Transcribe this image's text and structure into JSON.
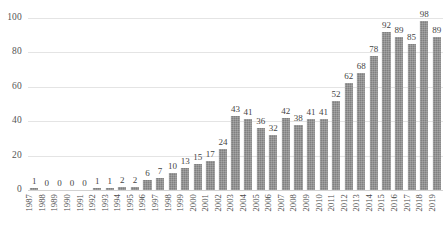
{
  "chart_data": {
    "type": "bar",
    "title": "",
    "subtitle": "",
    "xlabel": "",
    "ylabel": "",
    "ylim": [
      0,
      100
    ],
    "yticks": [
      0,
      20,
      40,
      60,
      80,
      100
    ],
    "grid": true,
    "legend": "none",
    "bar_color": "#808080",
    "gridline_color": "#e4e4e4",
    "value_labels": true,
    "categories": [
      "1987",
      "1988",
      "1989",
      "1990",
      "1991",
      "1992",
      "1993",
      "1994",
      "1995",
      "1996",
      "1997",
      "1998",
      "1999",
      "2000",
      "2001",
      "2002",
      "2003",
      "2004",
      "2005",
      "2006",
      "2007",
      "2008",
      "2009",
      "2010",
      "2011",
      "2012",
      "2013",
      "2014",
      "2015",
      "2016",
      "2017",
      "2018",
      "2019"
    ],
    "values": [
      1,
      0,
      0,
      0,
      0,
      1,
      1,
      2,
      2,
      6,
      7,
      10,
      13,
      15,
      17,
      24,
      43,
      41,
      36,
      32,
      42,
      38,
      41,
      41,
      52,
      62,
      68,
      78,
      92,
      89,
      85,
      98,
      89
    ]
  }
}
